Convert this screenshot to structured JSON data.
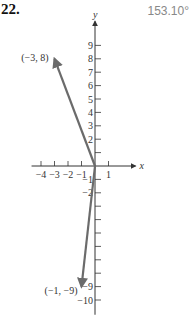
{
  "problem": {
    "number": "22.",
    "answer": "153.10°"
  },
  "chart_data": {
    "type": "vector-diagram",
    "xlabel": "x",
    "ylabel": "y",
    "x_ticks": [
      -4,
      -3,
      -2,
      -1,
      1
    ],
    "x_tick_labels": [
      "−4",
      "−3",
      "−2",
      "−1",
      "1"
    ],
    "y_ticks_positive": [
      1,
      2,
      3,
      4,
      5,
      6,
      7,
      8,
      9
    ],
    "y_tick_labels_positive": [
      "",
      "2",
      "3",
      "4",
      "5",
      "6",
      "7",
      "8",
      "9"
    ],
    "y_ticks_negative": [
      -1,
      -2,
      -3,
      -4,
      -5,
      -6,
      -7,
      -8,
      -9,
      -10
    ],
    "y_tick_labels_negative": [
      "−1",
      "−2",
      "",
      "",
      "",
      "",
      "",
      "",
      "−9",
      "−10"
    ],
    "xlim": [
      -4.5,
      2.5
    ],
    "ylim": [
      -10.5,
      10.5
    ],
    "vectors": [
      {
        "from": [
          0,
          0
        ],
        "to": [
          -3,
          8
        ],
        "label": "(−3, 8)"
      },
      {
        "from": [
          0,
          0
        ],
        "to": [
          -1,
          -9
        ],
        "label": "(−1, −9)"
      }
    ],
    "colors": {
      "axis": "#333333",
      "vector": "#6b6b6b"
    }
  }
}
